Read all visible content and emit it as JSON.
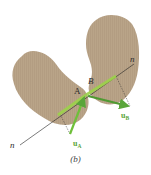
{
  "figure": {
    "caption": "(b)",
    "bodies": [
      {
        "name": "body-A",
        "color": "#b9a488"
      },
      {
        "name": "body-B",
        "color": "#b9a488"
      }
    ],
    "points": {
      "A": "A",
      "B": "B"
    },
    "normal_line": {
      "label_start": "n",
      "label_end": "n"
    },
    "vectors": {
      "uA": {
        "label": "u",
        "subscript": "A",
        "color": "#6fbf3a"
      },
      "uB": {
        "label": "u",
        "subscript": "B",
        "color": "#5aa53a"
      }
    },
    "colors": {
      "body": "#b9a488",
      "vector": "#7ac142",
      "line": "#222222"
    }
  }
}
